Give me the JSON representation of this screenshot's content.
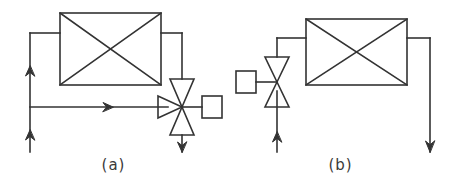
{
  "figure": {
    "type": "piping-schematic",
    "stroke_color": "#333333",
    "background_color": "#ffffff",
    "panels": [
      {
        "id": "a",
        "caption": "(a)",
        "description": "Heat exchanger with three-way mixing valve on the bypass line",
        "components": [
          {
            "name": "heat-exchanger",
            "symbol": "rectangle-with-x-diagonals"
          },
          {
            "name": "three-way-valve",
            "symbol": "bowtie-with-third-port"
          },
          {
            "name": "valve-actuator",
            "symbol": "square-box",
            "position": "right"
          },
          {
            "name": "supply-riser-arrow-lower",
            "symbol": "arrow-up"
          },
          {
            "name": "supply-riser-arrow-upper",
            "symbol": "arrow-up"
          },
          {
            "name": "bypass-line-arrow",
            "symbol": "arrow-right"
          },
          {
            "name": "outlet-arrow",
            "symbol": "arrow-down"
          }
        ]
      },
      {
        "id": "b",
        "caption": "(b)",
        "description": "Heat exchanger with two-way throttling valve on the supply line",
        "components": [
          {
            "name": "heat-exchanger",
            "symbol": "rectangle-with-x-diagonals"
          },
          {
            "name": "two-way-valve",
            "symbol": "bowtie"
          },
          {
            "name": "valve-actuator",
            "symbol": "square-box",
            "position": "left"
          },
          {
            "name": "inlet-arrow",
            "symbol": "arrow-up"
          },
          {
            "name": "outlet-arrow",
            "symbol": "arrow-down"
          }
        ]
      }
    ]
  },
  "captions": {
    "panel_a": "(a)",
    "panel_b": "(b)"
  }
}
